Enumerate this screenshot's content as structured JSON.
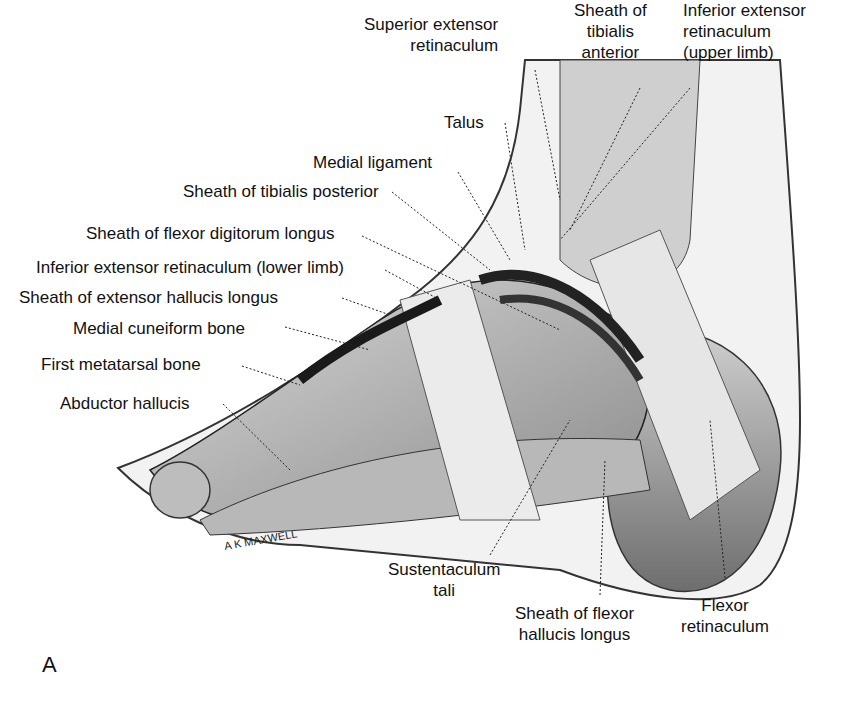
{
  "figure": {
    "panel_letter": "A",
    "signature": "A K MAXWELL",
    "labels": {
      "superior_extensor_retinaculum": [
        "Superior extensor",
        "retinaculum"
      ],
      "sheath_tibialis_anterior": [
        "Sheath of",
        "tibialis",
        "anterior"
      ],
      "inferior_extensor_retinaculum_upper": [
        "Inferior extensor",
        "retinaculum",
        "(upper limb)"
      ],
      "talus": "Talus",
      "medial_ligament": "Medial ligament",
      "sheath_tibialis_posterior": "Sheath of tibialis posterior",
      "sheath_flexor_digitorum_longus": "Sheath of flexor digitorum longus",
      "inferior_extensor_retinaculum_lower": "Inferior extensor retinaculum (lower limb)",
      "sheath_extensor_hallucis_longus": "Sheath of extensor hallucis longus",
      "medial_cuneiform_bone": "Medial cuneiform bone",
      "first_metatarsal_bone": "First metatarsal bone",
      "abductor_hallucis": "Abductor hallucis",
      "sustentaculum_tali": [
        "Sustentaculum",
        "tali"
      ],
      "sheath_flexor_hallucis_longus": [
        "Sheath of flexor",
        "hallucis longus"
      ],
      "flexor_retinaculum": [
        "Flexor",
        "retinaculum"
      ]
    }
  }
}
